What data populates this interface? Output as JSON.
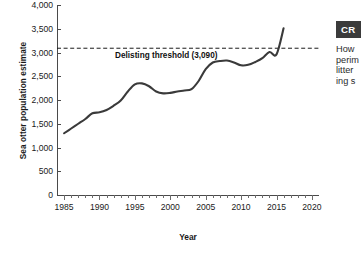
{
  "chart_data": {
    "type": "line",
    "title": "",
    "xlabel": "Year",
    "ylabel": "Sea otter population estimate",
    "xlim": [
      1984,
      2021
    ],
    "ylim": [
      0,
      4000
    ],
    "grid": false,
    "legend_position": "none",
    "y_ticks": [
      "0",
      "500",
      "1,000",
      "1,500",
      "2,000",
      "2,500",
      "3,000",
      "3,500",
      "4,000"
    ],
    "y_tick_values": [
      0,
      500,
      1000,
      1500,
      2000,
      2500,
      3000,
      3500,
      4000
    ],
    "x_ticks": [
      "1985",
      "1990",
      "1995",
      "2000",
      "2005",
      "2010",
      "2015",
      "2020"
    ],
    "x_tick_values": [
      1985,
      1990,
      1995,
      2000,
      2005,
      2010,
      2015,
      2020
    ],
    "series": [
      {
        "name": "Sea otter population estimate",
        "color": "#3a3a3a",
        "x": [
          1985,
          1986,
          1987,
          1988,
          1989,
          1990,
          1991,
          1992,
          1993,
          1994,
          1995,
          1996,
          1997,
          1998,
          1999,
          2000,
          2001,
          2002,
          2003,
          2004,
          2005,
          2006,
          2007,
          2008,
          2009,
          2010,
          2011,
          2012,
          2013,
          2014,
          2015,
          2016
        ],
        "values": [
          1300,
          1400,
          1500,
          1600,
          1720,
          1740,
          1790,
          1880,
          1990,
          2180,
          2330,
          2350,
          2290,
          2180,
          2140,
          2150,
          2180,
          2200,
          2230,
          2400,
          2650,
          2790,
          2820,
          2830,
          2790,
          2730,
          2740,
          2800,
          2880,
          3010,
          2960,
          3510
        ]
      }
    ],
    "annotations": [
      {
        "name": "delisting-threshold",
        "label": "Delisting threshold (3,090)",
        "value": 3090,
        "style": "dashed-horizontal-line",
        "color": "#1a1a1a"
      }
    ]
  },
  "chart": {
    "y_axis_title": "Sea otter population estimate",
    "x_axis_title": "Year",
    "threshold_label": "Delisting threshold (3,090)"
  },
  "callout": {
    "badge": "CR",
    "lines": [
      "How",
      "perim",
      "litter",
      "ing s"
    ]
  }
}
